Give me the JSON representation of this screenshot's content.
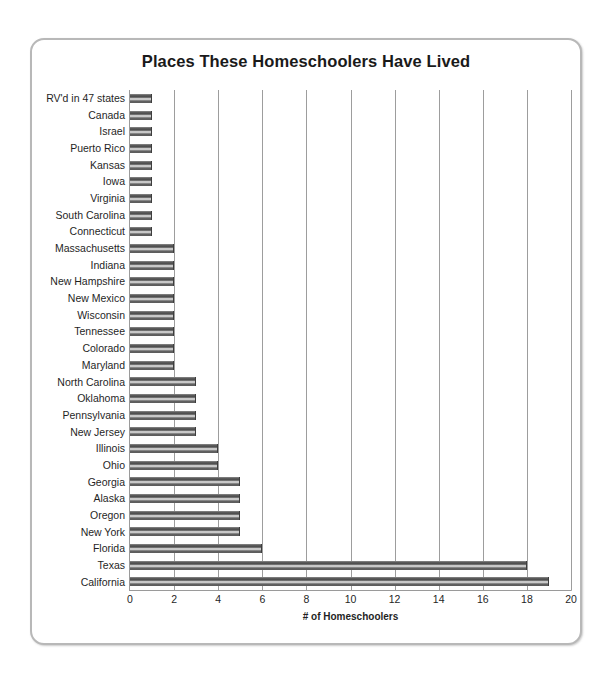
{
  "chart_data": {
    "type": "bar",
    "orientation": "horizontal",
    "title": "Places These Homeschoolers Have Lived",
    "xlabel": "# of Homeschoolers",
    "ylabel": "",
    "xlim": [
      0,
      20
    ],
    "xticks": [
      0,
      2,
      4,
      6,
      8,
      10,
      12,
      14,
      16,
      18,
      20
    ],
    "grid": true,
    "legend": null,
    "categories": [
      "RV'd in 47 states",
      "Canada",
      "Israel",
      "Puerto Rico",
      "Kansas",
      "Iowa",
      "Virginia",
      "South Carolina",
      "Connecticut",
      "Massachusetts",
      "Indiana",
      "New Hampshire",
      "New Mexico",
      "Wisconsin",
      "Tennessee",
      "Colorado",
      "Maryland",
      "North Carolina",
      "Oklahoma",
      "Pennsylvania",
      "New Jersey",
      "Illinois",
      "Ohio",
      "Georgia",
      "Alaska",
      "Oregon",
      "New York",
      "Florida",
      "Texas",
      "California"
    ],
    "values": [
      1,
      1,
      1,
      1,
      1,
      1,
      1,
      1,
      1,
      2,
      2,
      2,
      2,
      2,
      2,
      2,
      2,
      3,
      3,
      3,
      3,
      4,
      4,
      5,
      5,
      5,
      5,
      6,
      18,
      19
    ],
    "bar_color": "#6a6a6a"
  },
  "frame": {
    "border_color": "#b8b8b8"
  }
}
